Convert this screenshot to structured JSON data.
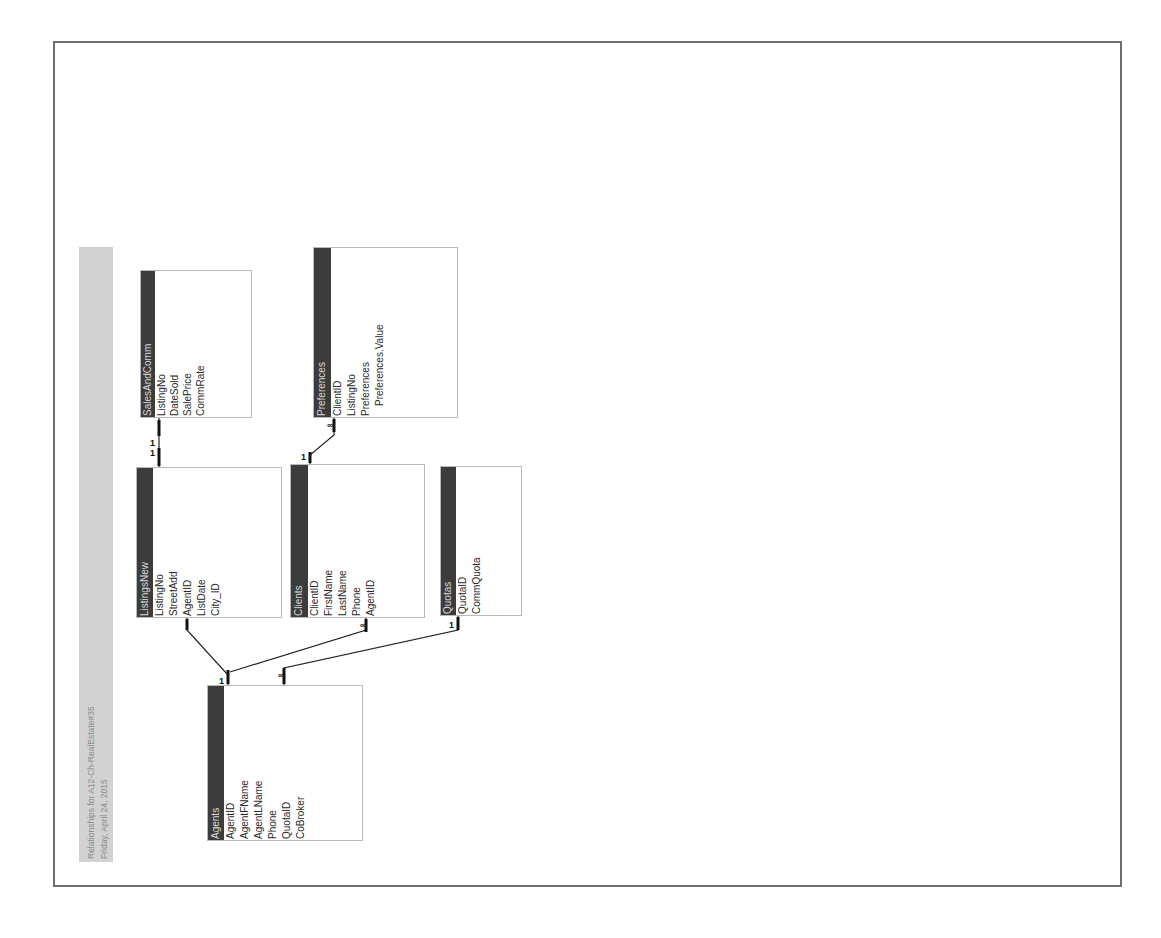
{
  "report": {
    "title": "Relationships for A12-Ch-RealEstate#35",
    "date": "Friday, April 24, 2015",
    "orientation": "rotated -90deg (landscape page shown in portrait)"
  },
  "tables": [
    {
      "id": "SalesAndComm",
      "name": "SalesAndComm",
      "fields": [
        "ListingNo",
        "DateSold",
        "SalePrice",
        "CommRate"
      ]
    },
    {
      "id": "ListingsNew",
      "name": "ListingsNew",
      "fields": [
        "ListingNo",
        "StreetAdd",
        "AgentID",
        "ListDate",
        "City_ID"
      ]
    },
    {
      "id": "Clients",
      "name": "Clients",
      "fields": [
        "ClientID",
        "FirstName",
        "LastName",
        "Phone",
        "AgentID"
      ]
    },
    {
      "id": "Preferences",
      "name": "Preferences",
      "fields": [
        "ClientID",
        "ListingNo",
        "Preferences",
        "Preferences.Value"
      ]
    },
    {
      "id": "Quotas",
      "name": "Quotas",
      "fields": [
        "QuotaID",
        "CommQuota"
      ]
    },
    {
      "id": "Agents",
      "name": "Agents",
      "fields": [
        "AgentID",
        "AgentFName",
        "AgentLName",
        "Phone",
        "QuotaID",
        "CoBroker"
      ]
    }
  ],
  "relationships": [
    {
      "from": "ListingsNew.ListingNo",
      "to": "SalesAndComm.ListingNo",
      "from_card": "1",
      "to_card": "1"
    },
    {
      "from": "Clients.ClientID",
      "to": "Preferences.ClientID",
      "from_card": "1",
      "to_card": "∞"
    },
    {
      "from": "Agents.AgentID",
      "to": "ListingsNew.AgentID",
      "from_card": "1",
      "to_card": ""
    },
    {
      "from": "Agents.AgentID",
      "to": "Clients.AgentID",
      "from_card": "1",
      "to_card": "∞"
    },
    {
      "from": "Quotas.QuotaID",
      "to": "Agents.QuotaID",
      "from_card": "1",
      "to_card": "∞"
    }
  ],
  "labels": {
    "one": "1",
    "many": "∞"
  }
}
